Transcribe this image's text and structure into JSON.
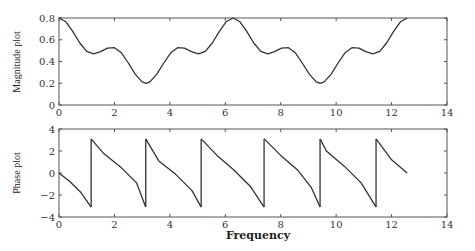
{
  "chart_data": [
    {
      "type": "line",
      "title": "",
      "xlabel": "",
      "ylabel": "Magnitude plot",
      "xlim": [
        0,
        14
      ],
      "ylim": [
        0,
        0.8
      ],
      "xticks": [
        "0",
        "2",
        "4",
        "6",
        "8",
        "10",
        "12",
        "14"
      ],
      "yticks": [
        "0",
        "0.2",
        "0.4",
        "0.6",
        "0.8"
      ],
      "grid": false,
      "series": [
        {
          "name": "magnitude",
          "x": [
            0,
            0.25,
            0.5,
            0.75,
            1.0,
            1.25,
            1.5,
            1.75,
            2.0,
            2.25,
            2.5,
            2.75,
            3.0,
            3.1416,
            3.28,
            3.53,
            3.78,
            4.03,
            4.28,
            4.53,
            4.78,
            5.03,
            5.28,
            5.53,
            5.78,
            6.03,
            6.2832,
            6.53,
            6.78,
            7.03,
            7.28,
            7.53,
            7.78,
            8.03,
            8.28,
            8.53,
            8.78,
            9.03,
            9.28,
            9.4248,
            9.57,
            9.82,
            10.07,
            10.32,
            10.57,
            10.82,
            11.07,
            11.32,
            11.57,
            11.82,
            12.07,
            12.32,
            12.5664
          ],
          "y": [
            0.8,
            0.765,
            0.675,
            0.57,
            0.494,
            0.47,
            0.49,
            0.523,
            0.527,
            0.48,
            0.386,
            0.284,
            0.212,
            0.2,
            0.212,
            0.284,
            0.386,
            0.48,
            0.527,
            0.523,
            0.49,
            0.47,
            0.494,
            0.57,
            0.675,
            0.765,
            0.8,
            0.765,
            0.675,
            0.57,
            0.494,
            0.47,
            0.49,
            0.523,
            0.527,
            0.48,
            0.386,
            0.284,
            0.212,
            0.2,
            0.212,
            0.284,
            0.386,
            0.48,
            0.527,
            0.523,
            0.49,
            0.47,
            0.494,
            0.57,
            0.675,
            0.765,
            0.8
          ]
        }
      ]
    },
    {
      "type": "line",
      "title": "",
      "xlabel": "Frequency",
      "ylabel": "Phase plot",
      "xlim": [
        0,
        14
      ],
      "ylim": [
        -4,
        4
      ],
      "xticks": [
        "0",
        "2",
        "4",
        "6",
        "8",
        "10",
        "12",
        "14"
      ],
      "yticks": [
        "−4",
        "−2",
        "0",
        "2",
        "4"
      ],
      "grid": false,
      "series": [
        {
          "name": "phase",
          "segments": [
            {
              "x": [
                0,
                0.4,
                0.8,
                1.16
              ],
              "y": [
                0,
                -0.8,
                -1.8,
                -3.1
              ]
            },
            {
              "x": [
                1.16,
                1.6,
                2.2,
                2.8,
                3.13
              ],
              "y": [
                3.1,
                1.8,
                0.6,
                -0.9,
                -3.1
              ]
            },
            {
              "x": [
                3.13,
                3.6,
                4.2,
                4.8,
                5.13
              ],
              "y": [
                3.1,
                1.1,
                -0.1,
                -1.6,
                -3.1
              ]
            },
            {
              "x": [
                5.13,
                5.7,
                6.3,
                6.9,
                7.4
              ],
              "y": [
                3.1,
                1.6,
                0.3,
                -1.2,
                -3.1
              ]
            },
            {
              "x": [
                7.4,
                8.0,
                8.6,
                9.1,
                9.42
              ],
              "y": [
                3.1,
                1.6,
                0.3,
                -1.3,
                -3.1
              ]
            },
            {
              "x": [
                9.42,
                9.65,
                10.3,
                10.9,
                11.44
              ],
              "y": [
                3.1,
                2.0,
                0.6,
                -0.9,
                -3.1
              ]
            },
            {
              "x": [
                11.44,
                12.0,
                12.56
              ],
              "y": [
                3.1,
                1.2,
                0.0
              ]
            }
          ]
        }
      ]
    }
  ],
  "labels": {
    "top_ylabel": "Magnitude plot",
    "bottom_ylabel": "Phase plot",
    "xlabel": "Frequency"
  }
}
